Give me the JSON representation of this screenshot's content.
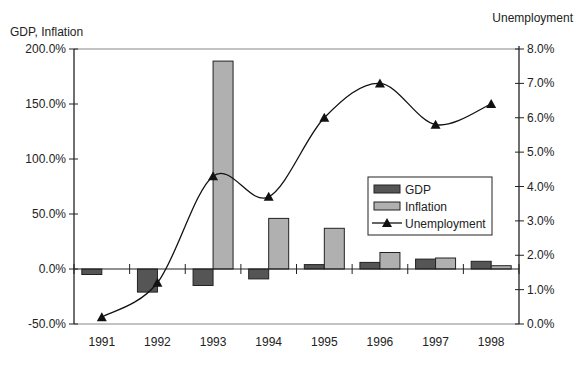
{
  "chart_data": {
    "type": "bar",
    "title": "",
    "categories": [
      "1991",
      "1992",
      "1993",
      "1994",
      "1995",
      "1996",
      "1997",
      "1998"
    ],
    "series": [
      {
        "name": "GDP",
        "type": "bar",
        "axis": "left",
        "color": "#555555",
        "values": [
          -5.0,
          -21.0,
          -15.0,
          -9.0,
          4.0,
          6.0,
          9.0,
          7.0
        ]
      },
      {
        "name": "Inflation",
        "type": "bar",
        "axis": "left",
        "color": "#b0b0b0",
        "values": [
          0.0,
          0.0,
          189.0,
          46.0,
          37.0,
          15.0,
          10.0,
          3.0
        ]
      },
      {
        "name": "Unemployment",
        "type": "line",
        "axis": "right",
        "color": "#111111",
        "marker": "triangle",
        "values": [
          0.2,
          1.2,
          4.3,
          3.7,
          6.0,
          7.0,
          5.8,
          6.4
        ]
      }
    ],
    "left_axis": {
      "label": "GDP, Inflation",
      "ylim": [
        -50,
        200
      ],
      "ticks": [
        "-50.0%",
        "0.0%",
        "50.0%",
        "100.0%",
        "150.0%",
        "200.0%"
      ],
      "tick_values": [
        -50,
        0,
        50,
        100,
        150,
        200
      ]
    },
    "right_axis": {
      "label": "Unemployment",
      "ylim": [
        0,
        8
      ],
      "ticks": [
        "0.0%",
        "1.0%",
        "2.0%",
        "3.0%",
        "4.0%",
        "5.0%",
        "6.0%",
        "7.0%",
        "8.0%"
      ],
      "tick_values": [
        0,
        1,
        2,
        3,
        4,
        5,
        6,
        7,
        8
      ]
    },
    "xlabel": "",
    "grid": false,
    "legend": {
      "position": "inside-right",
      "entries": [
        "GDP",
        "Inflation",
        "Unemployment"
      ]
    }
  }
}
